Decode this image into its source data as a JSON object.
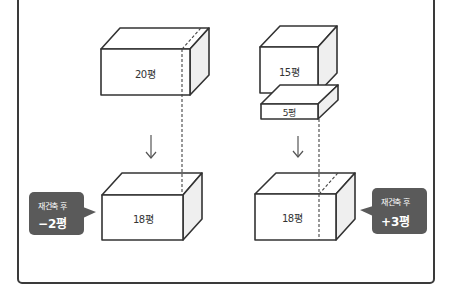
{
  "colors": {
    "line": "#333333",
    "side_face": "#efefef",
    "callout_bg": "#5a5a5a",
    "callout_text": "#ffffff"
  },
  "left_scenario": {
    "before_box": {
      "label": "20평"
    },
    "after_box": {
      "label": "18평"
    },
    "callout": {
      "caption": "재건축 후",
      "value": "−2평"
    }
  },
  "right_scenario": {
    "before_box_top": {
      "label": "15평"
    },
    "before_box_slab": {
      "label": "5평"
    },
    "after_box": {
      "label": "18평"
    },
    "callout": {
      "caption": "재건축 후",
      "value": "+3평"
    }
  },
  "icons": {
    "arrow": "arrow-down-icon"
  }
}
